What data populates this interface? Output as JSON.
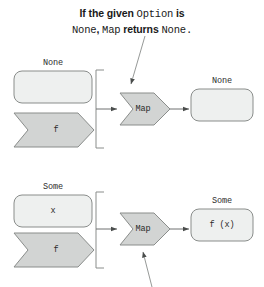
{
  "caption": {
    "line1_pre": "If the given ",
    "line1_code": "Option",
    "line1_post": " is",
    "line2_code1": "None",
    "line2_mid": ", ",
    "line2_code2": "Map",
    "line2_post": " returns ",
    "line2_code3": "None",
    "line2_end": "."
  },
  "colors": {
    "box_fill": "#eef0ef",
    "chevron_fill": "#d2d4d3",
    "stroke": "#8a8d8b",
    "line": "#6e7170",
    "text": "#2b2b2b"
  },
  "rows": [
    {
      "name": "none-row",
      "input_label": "None",
      "input_value": "",
      "function_label": "f",
      "operation_label": "Map",
      "output_label": "None",
      "output_value": ""
    },
    {
      "name": "some-row",
      "input_label": "Some",
      "input_value": "x",
      "function_label": "f",
      "operation_label": "Map",
      "output_label": "Some",
      "output_value": "f (x)"
    }
  ],
  "annotations": {
    "top_leader": "leader-line-to-map-top",
    "bottom_leader": "leader-line-to-map-bottom"
  }
}
